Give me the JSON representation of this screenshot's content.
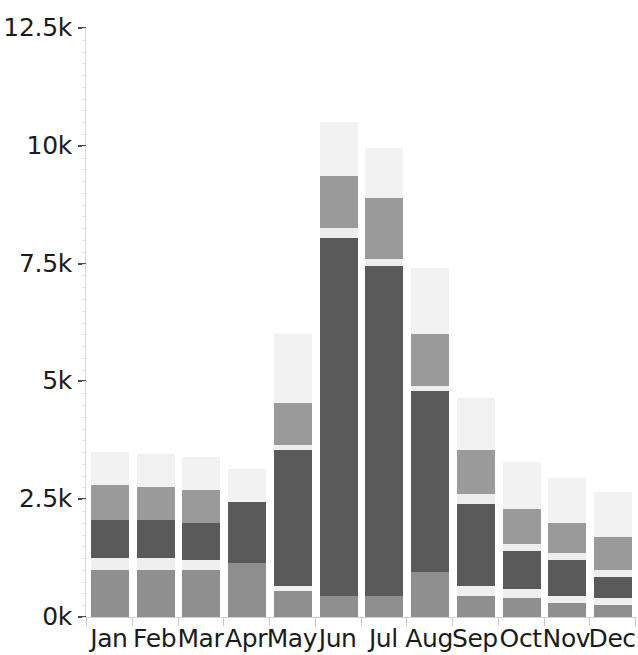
{
  "chart_data": {
    "type": "bar",
    "subtype": "stacked-bar",
    "title": "",
    "xlabel": "",
    "ylabel": "",
    "grid": false,
    "legend": "none",
    "ylim": [
      0,
      12500
    ],
    "ytick_values": [
      0,
      2500,
      5000,
      7500,
      10000,
      12500
    ],
    "ytick_labels": [
      "0k",
      "2.5k",
      "5k",
      "7.5k",
      "10k",
      "12.5k"
    ],
    "categories": [
      "Jan",
      "Feb",
      "Mar",
      "Apr",
      "May",
      "Jun",
      "Jul",
      "Aug",
      "Sep",
      "Oct",
      "Nov",
      "Dec"
    ],
    "series": [
      {
        "name": "series-1",
        "color": "#8f8f8f",
        "values": [
          1000,
          1000,
          1000,
          1150,
          550,
          450,
          450,
          950,
          450,
          400,
          300,
          250
        ]
      },
      {
        "name": "series-2",
        "color": "#efefef",
        "values": [
          250,
          250,
          200,
          0,
          100,
          0,
          0,
          0,
          200,
          200,
          150,
          150
        ]
      },
      {
        "name": "series-3",
        "color": "#5a5a5a",
        "values": [
          800,
          800,
          800,
          1300,
          2900,
          7600,
          7000,
          3850,
          1750,
          800,
          750,
          450
        ]
      },
      {
        "name": "series-4",
        "color": "#ededed",
        "values": [
          0,
          0,
          0,
          0,
          100,
          200,
          150,
          100,
          200,
          150,
          150,
          150
        ]
      },
      {
        "name": "series-5",
        "color": "#9a9a9a",
        "values": [
          750,
          700,
          700,
          0,
          900,
          1100,
          1300,
          1100,
          950,
          750,
          650,
          700
        ]
      },
      {
        "name": "series-6",
        "color": "#f2f2f2",
        "values": [
          700,
          700,
          700,
          700,
          1450,
          1150,
          1050,
          1400,
          1100,
          1000,
          950,
          950
        ]
      }
    ],
    "totals": [
      3500,
      3450,
      3400,
      3150,
      6000,
      10500,
      9950,
      7400,
      4650,
      3300,
      2950,
      2650
    ],
    "axis_label_color": "#1c1c1c",
    "axis_line_color": "#d8d8d8",
    "background_color": "#ffffff"
  },
  "axis": {
    "y_labels": [
      "12.5k",
      "10k",
      "7.5k",
      "5k",
      "2.5k",
      "0k"
    ],
    "x_labels": [
      "Jan",
      "Feb",
      "Mar",
      "Apr",
      "May",
      "Jun",
      "Jul",
      "Aug",
      "Sep",
      "Oct",
      "Nov",
      "Dec"
    ]
  }
}
